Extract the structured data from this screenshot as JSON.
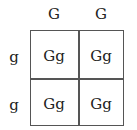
{
  "top_alleles": [
    "G",
    "G"
  ],
  "side_alleles": [
    "g",
    "g"
  ],
  "cells": [
    [
      "Gg",
      "Gg"
    ],
    [
      "Gg",
      "Gg"
    ]
  ]
}
